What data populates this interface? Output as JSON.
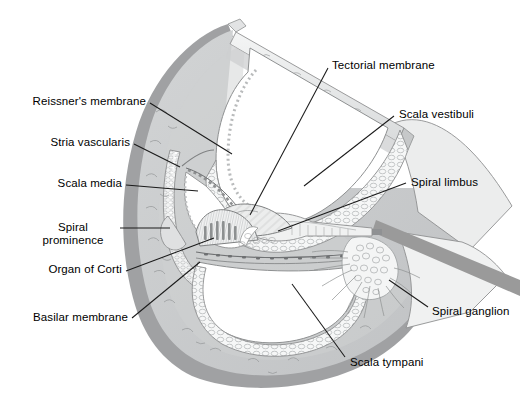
{
  "diagram": {
    "background_color": "#ffffff",
    "line_color": "#1a1a1a",
    "palette": {
      "outer_rim": "#8f9193",
      "bone_fill": "#c9cbcc",
      "bone_light": "#e9eaea",
      "tissue_light": "#f2f3f3",
      "lumen": "#ffffff",
      "nerve_band": "#9a9a9a",
      "stroke": "#6f7173"
    },
    "labels": [
      {
        "id": "reissners-membrane",
        "text": "Reissner's membrane",
        "side": "left",
        "x": 36,
        "y": 96,
        "anchor_x": 148,
        "anchor_y": 101,
        "leader": [
          [
            150,
            103
          ],
          [
            230,
            153
          ]
        ]
      },
      {
        "id": "stria-vascularis",
        "text": "Stria vascularis",
        "side": "left",
        "x": 47,
        "y": 137,
        "anchor_x": 132,
        "anchor_y": 142,
        "leader": [
          [
            134,
            144
          ],
          [
            178,
            166
          ]
        ]
      },
      {
        "id": "scala-media",
        "text": "Scala media",
        "side": "left",
        "x": 52,
        "y": 178,
        "anchor_x": 124,
        "anchor_y": 183,
        "leader": [
          [
            126,
            185
          ],
          [
            196,
            190
          ]
        ]
      },
      {
        "id": "spiral-prominence",
        "text": "Spiral\nprominence",
        "side": "left",
        "x": 43,
        "y": 222,
        "anchor_x": 117,
        "anchor_y": 228,
        "leader": [
          [
            120,
            228
          ],
          [
            168,
            228
          ]
        ]
      },
      {
        "id": "organ-of-corti",
        "text": "Organ of Corti",
        "side": "left",
        "x": 44,
        "y": 264,
        "anchor_x": 124,
        "anchor_y": 269,
        "leader": [
          [
            126,
            271
          ],
          [
            212,
            238
          ]
        ]
      },
      {
        "id": "basilar-membrane",
        "text": "Basilar membrane",
        "side": "left",
        "x": 28,
        "y": 313,
        "anchor_x": 130,
        "anchor_y": 318,
        "leader": [
          [
            132,
            318
          ],
          [
            198,
            262
          ]
        ]
      },
      {
        "id": "tectorial-membrane",
        "text": "Tectorial membrane",
        "side": "right",
        "x": 332,
        "y": 60,
        "anchor_x": 330,
        "anchor_y": 66,
        "leader": [
          [
            328,
            68
          ],
          [
            250,
            214
          ]
        ]
      },
      {
        "id": "scala-vestibuli",
        "text": "Scala vestibuli",
        "side": "right",
        "x": 399,
        "y": 109,
        "anchor_x": 396,
        "anchor_y": 115,
        "leader": [
          [
            394,
            116
          ],
          [
            303,
            185
          ]
        ]
      },
      {
        "id": "spiral-limbus",
        "text": "Spiral limbus",
        "side": "right",
        "x": 411,
        "y": 177,
        "anchor_x": 408,
        "anchor_y": 182,
        "leader": [
          [
            406,
            183
          ],
          [
            277,
            230
          ]
        ]
      },
      {
        "id": "spiral-ganglion",
        "text": "Spiral ganglion",
        "side": "right",
        "x": 432,
        "y": 306,
        "anchor_x": 430,
        "anchor_y": 311,
        "leader": [
          [
            428,
            308
          ],
          [
            390,
            281
          ]
        ]
      },
      {
        "id": "scala-tympani",
        "text": "Scala tympani",
        "side": "right",
        "x": 350,
        "y": 358,
        "anchor_x": 348,
        "anchor_y": 363,
        "leader": [
          [
            346,
            358
          ],
          [
            292,
            283
          ]
        ]
      }
    ],
    "structures": [
      {
        "id": "bony-wall",
        "name": "Outer bony wall of cochlea"
      },
      {
        "id": "vestibular-membrane",
        "name": "Reissner's (vestibular) membrane"
      },
      {
        "id": "scala-vestibuli-lumen",
        "name": "Scala vestibuli lumen"
      },
      {
        "id": "scala-media-lumen",
        "name": "Scala media (cochlear duct) lumen"
      },
      {
        "id": "scala-tympani-lumen",
        "name": "Scala tympani lumen"
      },
      {
        "id": "osseous-spiral-lamina",
        "name": "Osseous spiral lamina"
      },
      {
        "id": "tectorial-membrane-flap",
        "name": "Tectorial membrane"
      },
      {
        "id": "organ-of-corti-body",
        "name": "Organ of Corti"
      },
      {
        "id": "spiral-ganglion-cells",
        "name": "Spiral ganglion cell cluster"
      },
      {
        "id": "cochlear-nerve",
        "name": "Cochlear nerve fibre bundle"
      },
      {
        "id": "modiolus",
        "name": "Modiolus / central axis"
      }
    ]
  }
}
